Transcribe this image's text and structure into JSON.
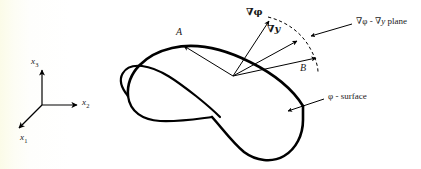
{
  "figure": {
    "name": "phi-surface-gradient-diagram",
    "background_color": "#ffffff",
    "tint_color": "#fbfbe8",
    "ink_color": "#000000"
  },
  "axes": {
    "name": "coordinate-triad",
    "origin": {
      "x": 42,
      "y": 105
    },
    "items": [
      {
        "key": "x1",
        "base": "x",
        "index": "1",
        "direction": "down-left",
        "tip": {
          "x": 17,
          "y": 130
        }
      },
      {
        "key": "x2",
        "base": "x",
        "index": "2",
        "direction": "right",
        "tip": {
          "x": 79,
          "y": 105
        }
      },
      {
        "key": "x3",
        "base": "x",
        "index": "3",
        "direction": "up",
        "tip": {
          "x": 42,
          "y": 68
        }
      }
    ],
    "labels": {
      "x1": "x",
      "x1_sub": "1",
      "x2": "x",
      "x2_sub": "2",
      "x3": "x",
      "x3_sub": "3"
    }
  },
  "surface": {
    "name": "phi-surface",
    "label": "φ - surface",
    "label_phi": "φ",
    "label_rest": " - surface",
    "description": "saddle shaped closed curve with self intersecting loop"
  },
  "vectors": {
    "apex": {
      "x": 233,
      "y": 76
    },
    "items": [
      {
        "key": "A",
        "label": "A",
        "tip": {
          "x": 182,
          "y": 44
        },
        "bold": false,
        "description": "tangent vector A pointing up-left"
      },
      {
        "key": "grad_phi",
        "label": "∇φ",
        "nabla": "∇",
        "symbol": "φ",
        "tip": {
          "x": 271,
          "y": 19
        },
        "bold": true,
        "description": "gradient of phi pointing up"
      },
      {
        "key": "grad_y",
        "label": "∇y",
        "nabla": "∇",
        "symbol": "y",
        "tip": {
          "x": 299,
          "y": 39
        },
        "bold": true,
        "description": "gradient of y pointing up-right"
      },
      {
        "key": "B",
        "label": "B",
        "tip": {
          "x": 318,
          "y": 57
        },
        "bold": false,
        "description": "tangent vector B pointing right"
      }
    ]
  },
  "annotations": [
    {
      "key": "plane",
      "name": "grad-phi-grad-y-plane-annotation",
      "text": "∇φ - ∇y  plane",
      "nabla1": "∇",
      "sym1": "φ",
      "dash": " - ",
      "nabla2": "∇",
      "sym2": "y",
      "suffix": "  plane",
      "leader_from": {
        "x": 352,
        "y": 24
      },
      "leader_to": {
        "x": 309,
        "y": 36
      }
    },
    {
      "key": "surface",
      "name": "phi-surface-annotation",
      "text": "φ - surface",
      "leader_from": {
        "x": 324,
        "y": 99
      },
      "leader_to": {
        "x": 286,
        "y": 110
      }
    }
  ],
  "arc": {
    "name": "plane-sector-arc",
    "style": "dashed",
    "description": "dashed arc spanning from grad-phi arrow tip to B arrow tip delimiting the plane"
  }
}
